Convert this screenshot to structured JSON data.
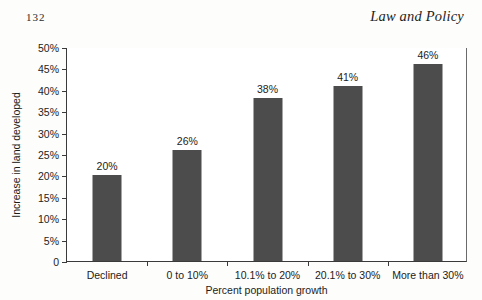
{
  "page": {
    "folio": "132",
    "running_head": "Law and Policy"
  },
  "chart_data": {
    "type": "bar",
    "title": "",
    "categories": [
      "Declined",
      "0 to 10%",
      "10.1% to 20%",
      "20.1% to 30%",
      "More than 30%"
    ],
    "values": [
      20,
      26,
      38,
      41,
      46
    ],
    "value_labels": [
      "20%",
      "26%",
      "38%",
      "41%",
      "46%"
    ],
    "xlabel": "Percent population growth",
    "ylabel": "Increase in land developed",
    "ylim": [
      0,
      50
    ],
    "ytick_values": [
      0,
      5,
      10,
      15,
      20,
      25,
      30,
      35,
      40,
      45,
      50
    ],
    "ytick_labels": [
      "0",
      "5%",
      "10%",
      "15%",
      "20%",
      "25%",
      "30%",
      "35%",
      "40%",
      "45%",
      "50%"
    ],
    "grid": false,
    "legend": false,
    "bar_color": "#4c4c4c",
    "axis_color": "#3a3a3a"
  }
}
